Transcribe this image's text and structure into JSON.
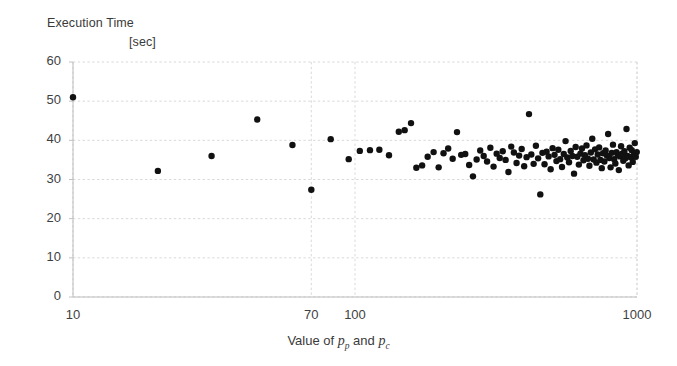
{
  "figure": {
    "background_color": "#ffffff",
    "point_color": "#111111",
    "grid_color": "#d9d9d9",
    "axis_color": "#bdbdbd"
  },
  "labels": {
    "title_line1": "Execution Time",
    "title_line2": "[sec]",
    "xaxis_prefix": "Value of ",
    "xaxis_var1": "p",
    "xaxis_sub1": "p",
    "xaxis_conj": " and ",
    "xaxis_var2": "p",
    "xaxis_sub2": "c"
  },
  "chart_data": {
    "type": "scatter",
    "title": "Execution Time [sec]",
    "xlabel": "Value of p_p and p_c",
    "ylabel": "Execution Time [sec]",
    "xscale": "log",
    "yscale": "linear",
    "xlim": [
      10,
      1000
    ],
    "ylim": [
      0,
      60
    ],
    "grid": true,
    "legend": null,
    "xticks": [
      10,
      70,
      100,
      1000
    ],
    "xtick_labels": [
      "10",
      "70",
      "100",
      "1000"
    ],
    "yticks": [
      0,
      10,
      20,
      30,
      40,
      50,
      60
    ],
    "ytick_labels": [
      "0",
      "10",
      "20",
      "30",
      "40",
      "50",
      "60"
    ],
    "marker": "filled-circle",
    "marker_size_px": 6.4,
    "series": [
      {
        "name": "execution time",
        "points": [
          [
            10,
            51.0
          ],
          [
            20,
            32.2
          ],
          [
            31,
            36.0
          ],
          [
            45,
            45.3
          ],
          [
            60,
            38.8
          ],
          [
            70,
            27.4
          ],
          [
            82,
            40.3
          ],
          [
            95,
            35.2
          ],
          [
            104,
            37.3
          ],
          [
            113,
            37.5
          ],
          [
            122,
            37.6
          ],
          [
            132,
            36.2
          ],
          [
            143,
            42.2
          ],
          [
            150,
            42.6
          ],
          [
            158,
            44.4
          ],
          [
            165,
            33.0
          ],
          [
            173,
            33.6
          ],
          [
            181,
            35.8
          ],
          [
            190,
            37.0
          ],
          [
            198,
            33.1
          ],
          [
            206,
            36.7
          ],
          [
            214,
            37.9
          ],
          [
            222,
            35.3
          ],
          [
            230,
            42.1
          ],
          [
            238,
            36.3
          ],
          [
            246,
            36.5
          ],
          [
            254,
            33.7
          ],
          [
            262,
            30.8
          ],
          [
            270,
            35.1
          ],
          [
            278,
            37.4
          ],
          [
            286,
            36.0
          ],
          [
            294,
            34.6
          ],
          [
            302,
            38.1
          ],
          [
            310,
            33.3
          ],
          [
            318,
            36.6
          ],
          [
            326,
            35.5
          ],
          [
            334,
            37.2
          ],
          [
            342,
            35.0
          ],
          [
            350,
            31.9
          ],
          [
            358,
            38.4
          ],
          [
            366,
            36.9
          ],
          [
            374,
            34.2
          ],
          [
            382,
            36.1
          ],
          [
            390,
            37.8
          ],
          [
            398,
            33.4
          ],
          [
            406,
            35.7
          ],
          [
            414,
            46.7
          ],
          [
            422,
            36.4
          ],
          [
            430,
            34.0
          ],
          [
            438,
            38.6
          ],
          [
            446,
            35.4
          ],
          [
            454,
            26.2
          ],
          [
            462,
            36.8
          ],
          [
            470,
            33.9
          ],
          [
            478,
            37.1
          ],
          [
            486,
            35.9
          ],
          [
            494,
            32.6
          ],
          [
            502,
            38.0
          ],
          [
            510,
            36.3
          ],
          [
            518,
            34.7
          ],
          [
            526,
            37.6
          ],
          [
            534,
            35.2
          ],
          [
            542,
            33.2
          ],
          [
            550,
            36.5
          ],
          [
            558,
            39.8
          ],
          [
            566,
            35.6
          ],
          [
            574,
            34.4
          ],
          [
            582,
            37.3
          ],
          [
            590,
            36.0
          ],
          [
            598,
            31.5
          ],
          [
            606,
            38.3
          ],
          [
            614,
            35.8
          ],
          [
            622,
            33.8
          ],
          [
            630,
            36.6
          ],
          [
            638,
            37.9
          ],
          [
            646,
            34.9
          ],
          [
            654,
            36.2
          ],
          [
            662,
            38.7
          ],
          [
            670,
            35.3
          ],
          [
            678,
            33.5
          ],
          [
            686,
            36.9
          ],
          [
            694,
            40.4
          ],
          [
            702,
            35.1
          ],
          [
            710,
            37.7
          ],
          [
            718,
            34.3
          ],
          [
            726,
            36.4
          ],
          [
            734,
            38.2
          ],
          [
            742,
            35.0
          ],
          [
            750,
            32.9
          ],
          [
            758,
            36.7
          ],
          [
            766,
            34.6
          ],
          [
            774,
            37.4
          ],
          [
            782,
            36.1
          ],
          [
            790,
            41.6
          ],
          [
            798,
            35.5
          ],
          [
            806,
            33.1
          ],
          [
            814,
            36.8
          ],
          [
            822,
            38.9
          ],
          [
            830,
            35.2
          ],
          [
            838,
            34.1
          ],
          [
            846,
            37.0
          ],
          [
            854,
            36.3
          ],
          [
            862,
            32.4
          ],
          [
            870,
            35.9
          ],
          [
            878,
            38.5
          ],
          [
            886,
            36.6
          ],
          [
            894,
            34.8
          ],
          [
            902,
            37.2
          ],
          [
            910,
            35.4
          ],
          [
            918,
            42.9
          ],
          [
            926,
            36.0
          ],
          [
            934,
            33.6
          ],
          [
            942,
            38.1
          ],
          [
            950,
            35.7
          ],
          [
            958,
            37.5
          ],
          [
            966,
            34.5
          ],
          [
            974,
            36.2
          ],
          [
            982,
            39.3
          ],
          [
            990,
            35.8
          ],
          [
            998,
            37.0
          ]
        ]
      }
    ]
  },
  "geometry": {
    "plot_left_px": 73,
    "plot_right_px": 637,
    "plot_top_px": 62,
    "plot_bottom_px": 297
  }
}
